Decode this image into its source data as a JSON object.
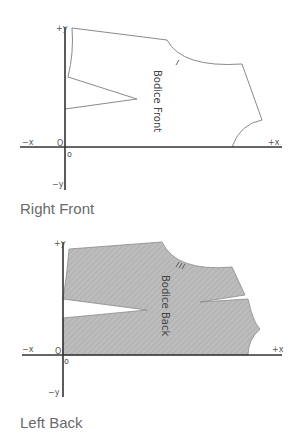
{
  "figures": [
    {
      "caption": "Right Front",
      "piece_label": "Bodice Front",
      "axes": {
        "pos_y": "+y",
        "neg_y": "−y",
        "pos_x": "+x",
        "neg_x": "−x",
        "origin_upper": "O",
        "origin_lower": "o"
      },
      "fill": "none",
      "stroke": "#8a8a8a"
    },
    {
      "caption": "Left Back",
      "piece_label": "Bodice Back",
      "axes": {
        "pos_y": "+y",
        "neg_y": "−y",
        "pos_x": "+x",
        "neg_x": "−x",
        "origin_upper": "O",
        "origin_lower": "o"
      },
      "fill": "#b9b9b9",
      "stroke": "#8a8a8a"
    }
  ]
}
